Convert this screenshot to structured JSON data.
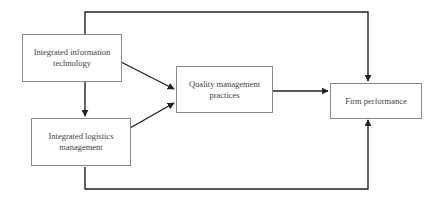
{
  "diagram": {
    "nodes": [
      {
        "id": "iit",
        "label": "Integrated information technology"
      },
      {
        "id": "ilm",
        "label": "Integrated logistics management"
      },
      {
        "id": "qmp",
        "label": "Quality management practices"
      },
      {
        "id": "fp",
        "label": "Firm performance"
      }
    ],
    "edges": [
      {
        "from": "Integrated information technology",
        "to": "Quality management practices"
      },
      {
        "from": "Integrated information technology",
        "to": "Integrated logistics management"
      },
      {
        "from": "Integrated logistics management",
        "to": "Quality management practices"
      },
      {
        "from": "Quality management practices",
        "to": "Firm performance"
      },
      {
        "from": "Integrated information technology",
        "to": "Firm performance"
      },
      {
        "from": "Integrated logistics management",
        "to": "Firm performance"
      }
    ],
    "colors": {
      "line": "#222222",
      "box_border": "#8a8a8a",
      "text": "#444444"
    }
  }
}
